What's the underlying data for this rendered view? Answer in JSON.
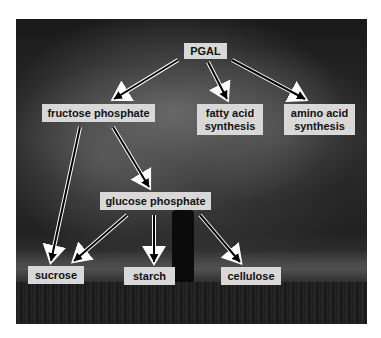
{
  "diagram": {
    "background": "black-and-white photograph of a large tree",
    "nodes": [
      {
        "id": "pgal",
        "label": "PGAL"
      },
      {
        "id": "fructose",
        "label": "fructose phosphate"
      },
      {
        "id": "fatty",
        "label": "fatty acid\nsynthesis"
      },
      {
        "id": "amino",
        "label": "amino acid\nsynthesis"
      },
      {
        "id": "glucose",
        "label": "glucose phosphate"
      },
      {
        "id": "sucrose",
        "label": "sucrose"
      },
      {
        "id": "starch",
        "label": "starch"
      },
      {
        "id": "cellulose",
        "label": "cellulose"
      }
    ],
    "edges": [
      {
        "from": "PGAL",
        "to": "fructose phosphate"
      },
      {
        "from": "PGAL",
        "to": "fatty acid synthesis"
      },
      {
        "from": "PGAL",
        "to": "amino acid synthesis"
      },
      {
        "from": "fructose phosphate",
        "to": "sucrose"
      },
      {
        "from": "fructose phosphate",
        "to": "glucose phosphate"
      },
      {
        "from": "glucose phosphate",
        "to": "sucrose"
      },
      {
        "from": "glucose phosphate",
        "to": "starch"
      },
      {
        "from": "glucose phosphate",
        "to": "cellulose"
      }
    ],
    "colors": {
      "label_bg": "#d8d8d8",
      "label_text": "#111111",
      "arrow_fill": "#000000",
      "arrow_outline": "#ffffff"
    }
  }
}
